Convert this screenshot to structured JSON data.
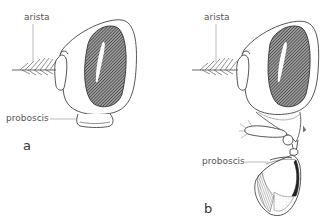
{
  "figure": {
    "panels": [
      {
        "id": "a",
        "panel_label": "a",
        "labels": {
          "arista": "arista",
          "proboscis": "proboscis"
        },
        "state": "proboscis retracted"
      },
      {
        "id": "b",
        "panel_label": "b",
        "labels": {
          "arista": "arista",
          "proboscis": "proboscis"
        },
        "state": "proboscis extended"
      }
    ],
    "colors": {
      "line": "#444444",
      "label_text": "#555555",
      "eye_fill": "#5a5a5a",
      "background": "#ffffff"
    }
  }
}
